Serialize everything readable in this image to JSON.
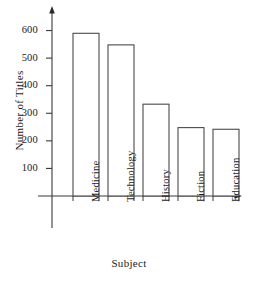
{
  "chart_data": {
    "type": "bar",
    "title": "",
    "categories": [
      "Medicine",
      "Technology",
      "History",
      "Fiction",
      "Education"
    ],
    "values": [
      590,
      548,
      333,
      248,
      242
    ],
    "xlabel": "Subject",
    "ylabel": "Number of Titles",
    "yticks": [
      100,
      200,
      300,
      400,
      500,
      600
    ],
    "ytick_labels": [
      "100",
      "200",
      "300",
      "400",
      "500",
      "600"
    ],
    "ylim": [
      0,
      660
    ],
    "grid": false,
    "legend": false,
    "bar_style": "outline",
    "colors": {
      "axis": "#3a3a3a",
      "bar_edge": "#4a4a4a",
      "bar_fill": "#ffffff",
      "text": "#1a1a1a",
      "background": "#ffffff"
    }
  }
}
